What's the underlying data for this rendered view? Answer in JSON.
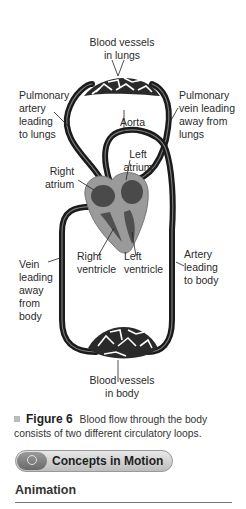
{
  "diagram": {
    "labels": {
      "vessels_lungs": "Blood vessels\nin lungs",
      "pulmonary_artery": "Pulmonary\nartery\nleading\nto lungs",
      "pulmonary_vein": "Pulmonary\nvein leading\naway from\nlungs",
      "aorta": "Aorta",
      "left_atrium": "Left\natrium",
      "right_atrium": "Right\natrium",
      "right_ventricle": "Right\nventricle",
      "left_ventricle": "Left\nventricle",
      "vein_body": "Vein\nleading\naway\nfrom\nbody",
      "artery_body": "Artery\nleading\nto body",
      "vessels_body": "Blood vessels\nin body"
    }
  },
  "caption": {
    "figure_label": "Figure 6",
    "text": "Blood flow through the body consists of two different circulatory loops."
  },
  "concepts_button": {
    "label": "Concepts in Motion",
    "icon": "concentric-circles-icon"
  },
  "section": {
    "title": "Animation"
  }
}
